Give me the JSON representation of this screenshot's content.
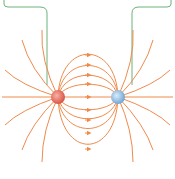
{
  "diagram": {
    "charges": [
      {
        "sign": "+",
        "x": 58,
        "y": 97,
        "color": "#e8705a"
      },
      {
        "sign": "-",
        "x": 118,
        "y": 97,
        "color": "#7fb2dc"
      }
    ],
    "colors": {
      "field_line": "#f08a4b",
      "bracket": "#6cb07a"
    }
  }
}
